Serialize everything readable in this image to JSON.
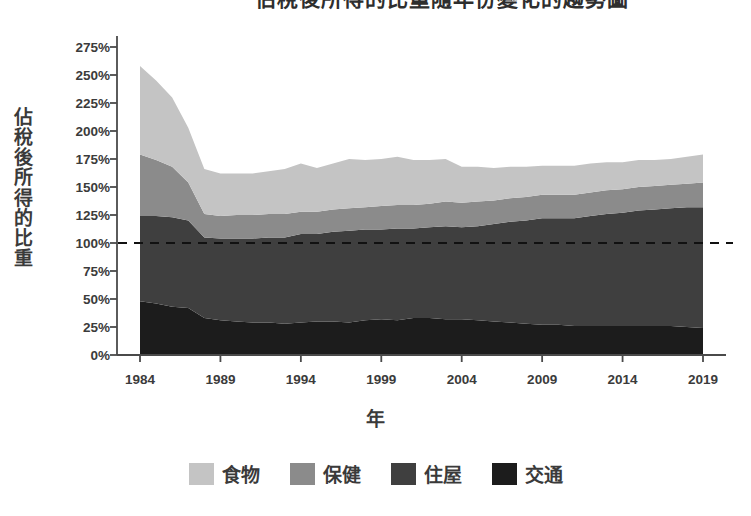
{
  "title": "佔稅後所得的比重隨年份變化的趨勢圖",
  "axes": {
    "ylabel": "佔稅後所得的比重",
    "xlabel": "年",
    "yticks": [
      "0%",
      "25%",
      "50%",
      "75%",
      "100%",
      "125%",
      "150%",
      "175%",
      "200%",
      "225%",
      "250%",
      "275%"
    ],
    "xticks": [
      "1984",
      "1989",
      "1994",
      "1999",
      "2004",
      "2009",
      "2014",
      "2019"
    ]
  },
  "legend": [
    {
      "label": "食物",
      "color": "#c4c4c4",
      "name": "food"
    },
    {
      "label": "保健",
      "color": "#8b8b8b",
      "name": "healthcare"
    },
    {
      "label": "住屋",
      "color": "#3f3f3f",
      "name": "housing"
    },
    {
      "label": "交通",
      "color": "#1c1c1c",
      "name": "transport"
    }
  ],
  "reference_line": {
    "value": 100,
    "style": "dashed",
    "color": "#111111"
  },
  "chart_data": {
    "type": "area",
    "stacked": true,
    "title": "佔稅後所得的比重隨年份變化的趨勢圖",
    "xlabel": "年",
    "ylabel": "佔稅後所得的比重",
    "xlim": [
      1984,
      2019
    ],
    "ylim": [
      0,
      287
    ],
    "ytick_values": [
      0,
      25,
      50,
      75,
      100,
      125,
      150,
      175,
      200,
      225,
      250,
      275
    ],
    "xtick_values": [
      1984,
      1989,
      1994,
      1999,
      2004,
      2009,
      2014,
      2019
    ],
    "grid": false,
    "legend_position": "bottom",
    "annotations": [
      {
        "type": "hline",
        "y": 100,
        "label": "100%",
        "style": "dashed"
      }
    ],
    "x": [
      1984,
      1985,
      1986,
      1987,
      1988,
      1989,
      1990,
      1991,
      1992,
      1993,
      1994,
      1995,
      1996,
      1997,
      1998,
      1999,
      2000,
      2001,
      2002,
      2003,
      2004,
      2005,
      2006,
      2007,
      2008,
      2009,
      2010,
      2011,
      2012,
      2013,
      2014,
      2015,
      2016,
      2017,
      2018,
      2019
    ],
    "series": [
      {
        "name": "交通",
        "color": "#1c1c1c",
        "values": [
          48,
          46,
          43,
          42,
          33,
          31,
          30,
          29,
          29,
          28,
          29,
          30,
          30,
          29,
          31,
          32,
          31,
          33,
          33,
          32,
          32,
          31,
          30,
          29,
          28,
          27,
          27,
          26,
          26,
          26,
          26,
          26,
          26,
          26,
          25,
          24
        ]
      },
      {
        "name": "住屋",
        "color": "#3f3f3f",
        "values": [
          76,
          78,
          80,
          78,
          72,
          73,
          74,
          75,
          76,
          77,
          79,
          78,
          80,
          82,
          81,
          80,
          82,
          80,
          81,
          83,
          82,
          84,
          87,
          90,
          92,
          95,
          95,
          96,
          98,
          100,
          101,
          103,
          104,
          105,
          107,
          108
        ]
      },
      {
        "name": "保健",
        "color": "#8b8b8b",
        "values": [
          55,
          50,
          45,
          34,
          21,
          20,
          21,
          21,
          21,
          21,
          20,
          20,
          20,
          20,
          20,
          21,
          21,
          21,
          21,
          22,
          22,
          22,
          21,
          21,
          21,
          21,
          21,
          21,
          21,
          21,
          21,
          21,
          21,
          21,
          21,
          22
        ]
      },
      {
        "name": "食物",
        "color": "#c4c4c4",
        "values": [
          79,
          71,
          62,
          49,
          40,
          38,
          37,
          37,
          38,
          40,
          43,
          39,
          41,
          44,
          42,
          42,
          43,
          40,
          39,
          38,
          32,
          31,
          29,
          28,
          27,
          26,
          26,
          26,
          26,
          25,
          24,
          24,
          23,
          23,
          24,
          25
        ]
      }
    ],
    "totals": [
      258,
      245,
      230,
      203,
      166,
      162,
      162,
      162,
      164,
      166,
      171,
      167,
      171,
      175,
      174,
      175,
      177,
      174,
      174,
      175,
      168,
      168,
      167,
      168,
      168,
      169,
      169,
      169,
      171,
      172,
      172,
      174,
      174,
      175,
      177,
      179
    ]
  }
}
